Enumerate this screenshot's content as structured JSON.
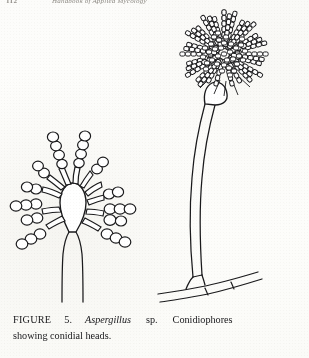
{
  "document": {
    "type": "scanned-book-page",
    "background_color": "#fdfdfb",
    "ink_color": "#1a1a1c"
  },
  "running_header": {
    "folio": "112",
    "title": "Handbook of Applied Mycology",
    "visible": "clipped-at-top-edge"
  },
  "figure": {
    "label": "Aspergillus conidiophores line drawing",
    "specimens": [
      {
        "name": "left-specimen",
        "description": "Aspergillus conidiophore with pyriform vesicle bearing radiating phialides and short chains of conidia",
        "parts": [
          "stipe",
          "vesicle",
          "phialides",
          "conidial-chains"
        ]
      },
      {
        "name": "right-specimen",
        "description": "Aspergillus conidiophore with long stipe, foot cell on basal hypha, and dense globose conidial head",
        "parts": [
          "foot-cell",
          "basal-hypha",
          "stipe",
          "vesicle",
          "dense-conidial-head"
        ]
      }
    ]
  },
  "caption": {
    "figure_word": "FIGURE",
    "number": "5.",
    "genus": "Aspergillus",
    "species": "sp.",
    "subject": "Conidiophores",
    "line2": "showing conidial heads."
  }
}
